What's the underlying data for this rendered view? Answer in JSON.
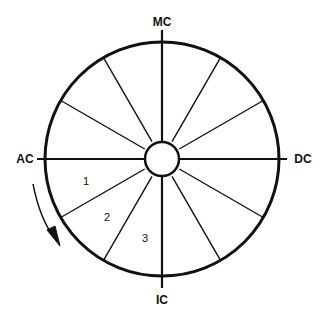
{
  "diagram": {
    "type": "house-wheel",
    "center": [
      162,
      159
    ],
    "outer_radius": 117,
    "inner_radius": 17,
    "spoke_count": 12,
    "line_color": "#111111",
    "axes": {
      "top": "MC",
      "bottom": "IC",
      "left": "AC",
      "right": "DC"
    },
    "houses": [
      {
        "number": "1",
        "x": 86,
        "y": 185
      },
      {
        "number": "2",
        "x": 107,
        "y": 221
      },
      {
        "number": "3",
        "x": 145,
        "y": 242
      }
    ],
    "direction_arrow": "counterclockwise-down"
  }
}
